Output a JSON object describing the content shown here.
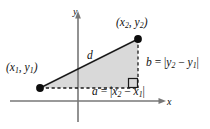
{
  "figure": {
    "background_color": "#ffffff",
    "stroke_color": "#1a1a1a",
    "axis_color": "#6e6e6e",
    "triangle_fill": "#d9d9d9",
    "axes": {
      "x_label": "x",
      "y_label": "y",
      "x_axis_y": 101,
      "y_axis_x": 78
    },
    "points": [
      {
        "name": "point-1",
        "label_text": "(x1, y1)",
        "x": 40,
        "y": 88
      },
      {
        "name": "point-2",
        "label_text": "(x2, y2)",
        "x": 138,
        "y": 39
      }
    ],
    "labels": {
      "point1": {
        "open": "(",
        "var1": "x",
        "sub1": "1",
        "sep": ", ",
        "var2": "y",
        "sub2": "1",
        "close": ")"
      },
      "point2": {
        "open": "(",
        "var1": "x",
        "sub1": "2",
        "sep": ", ",
        "var2": "y",
        "sub2": "2",
        "close": ")"
      },
      "hypotenuse": "d",
      "vertical_leg": {
        "leg": "b",
        "eq": " = |",
        "minuend": "y",
        "minuend_sub": "2",
        "minus": " − ",
        "subtrahend": "y",
        "subtrahend_sub": "1",
        "close": "|"
      },
      "horizontal_leg": {
        "leg": "a",
        "eq": " = |",
        "minuend": "x",
        "minuend_sub": "2",
        "minus": " − ",
        "subtrahend": "x",
        "subtrahend_sub": "1",
        "close": "|"
      }
    },
    "right_angle_marker": {
      "x": 128,
      "y": 78,
      "size": 9
    }
  }
}
